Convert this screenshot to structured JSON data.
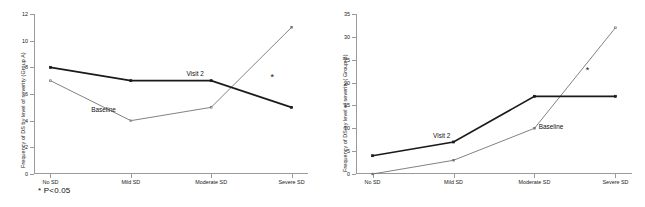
{
  "figure": {
    "footnote": "* P<0.05",
    "significance_marker": "*",
    "line_color_visit2": "#1a1a1a",
    "line_color_baseline": "#6b6b6b",
    "axis_color": "#9a9a9a",
    "background": "#ffffff"
  },
  "chart_data": [
    {
      "type": "line",
      "title": "",
      "panel": "A",
      "xlabel": "",
      "ylabel": "Frequency of DS by level of severity (Group A)",
      "categories": [
        "No SD",
        "Mild SD",
        "Moderate SD",
        "Severe SD"
      ],
      "yticks": [
        0,
        2,
        4,
        6,
        8,
        10,
        12
      ],
      "ylim": [
        0,
        12
      ],
      "grid": false,
      "legend": "inline-annotations",
      "series": [
        {
          "name": "Baseline",
          "values": [
            7,
            4,
            5,
            11
          ]
        },
        {
          "name": "Visit 2",
          "values": [
            8,
            7,
            7,
            5
          ]
        }
      ],
      "annotations": [
        {
          "text": "Visit 2",
          "x_frac": 0.6,
          "y_value": 7.6
        },
        {
          "text": "Baseline",
          "x_frac": 0.22,
          "y_value": 4.9
        },
        {
          "text": "*",
          "x_frac": 0.92,
          "y_value": 7.3
        }
      ]
    },
    {
      "type": "line",
      "title": "",
      "panel": "B",
      "xlabel": "",
      "ylabel": "Frequency of DS by level of severity ( Group B)",
      "categories": [
        "No SD",
        "Mild SD",
        "Moderate SD",
        "Severe SD"
      ],
      "yticks": [
        0,
        5,
        10,
        15,
        20,
        25,
        30,
        35
      ],
      "ylim": [
        0,
        35
      ],
      "grid": false,
      "legend": "inline-annotations",
      "series": [
        {
          "name": "Baseline",
          "values": [
            0,
            3,
            10,
            32
          ]
        },
        {
          "name": "Visit 2",
          "values": [
            4,
            7,
            17,
            17
          ]
        }
      ],
      "annotations": [
        {
          "text": "Visit 2",
          "x_frac": 0.285,
          "y_value": 8.6
        },
        {
          "text": "Baseline",
          "x_frac": 0.735,
          "y_value": 10.4
        },
        {
          "text": "*",
          "x_frac": 0.885,
          "y_value": 22.8
        }
      ]
    }
  ]
}
